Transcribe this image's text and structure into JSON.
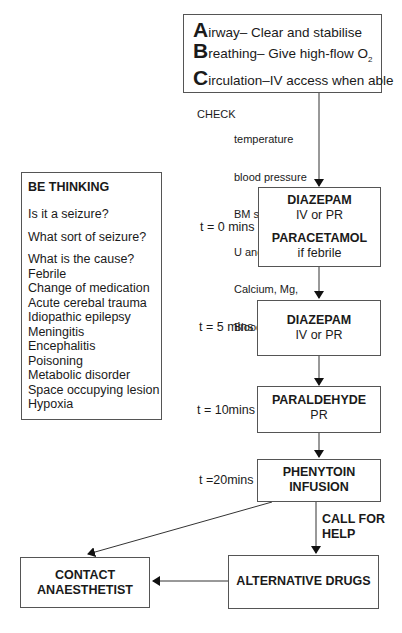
{
  "abc_box": {
    "lines": [
      {
        "letter": "A",
        "rest": "irway– Clear and stabilise"
      },
      {
        "letter": "B",
        "rest": "reathing– Give high-flow O",
        "sub": "2"
      },
      {
        "letter": "C",
        "rest": "irculation–IV access when able"
      }
    ]
  },
  "check": {
    "label": "CHECK",
    "items": [
      "temperature",
      "blood pressure",
      "BM stix",
      "U and E",
      "Calcium, Mg,",
      "Blood gas"
    ]
  },
  "be_thinking": {
    "title": "BE THINKING",
    "questions": [
      "Is it a seizure?",
      "What sort of seizure?",
      "What is the cause?"
    ],
    "causes": [
      "Febrile",
      "Change of medication",
      "Acute cerebal trauma",
      "Idiopathic epilepsy",
      "Meningitis",
      "Encephalitis",
      "Poisoning",
      "Metabolic disorder",
      "Space occupying lesion",
      "Hypoxia"
    ]
  },
  "steps": [
    {
      "time": "t = 0 mins",
      "drug": "DIAZEPAM",
      "route": "IV or PR",
      "drug2": "PARACETAMOL",
      "route2": "if febrile"
    },
    {
      "time": "t = 5 mins",
      "drug": "DIAZEPAM",
      "route": "IV or PR"
    },
    {
      "time": "t = 10mins",
      "drug": "PARALDEHYDE",
      "route": "PR"
    },
    {
      "time": "t =20mins",
      "drug": "PHENYTOIN",
      "route": "INFUSION"
    }
  ],
  "call_for_help": {
    "line1": "CALL FOR",
    "line2": "HELP"
  },
  "alternative_drugs": "ALTERNATIVE DRUGS",
  "contact": {
    "line1": "CONTACT",
    "line2": "ANAESTHETIST"
  }
}
